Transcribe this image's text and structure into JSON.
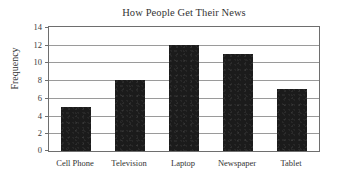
{
  "chart_data": {
    "type": "bar",
    "title": "How People Get Their News",
    "xlabel": "",
    "ylabel": "Frequency",
    "categories": [
      "Cell Phone",
      "Television",
      "Laptop",
      "Newspaper",
      "Tablet"
    ],
    "values": [
      5,
      8,
      12,
      11,
      7
    ],
    "ylim": [
      0,
      14
    ],
    "yticks": [
      0,
      2,
      4,
      6,
      8,
      10,
      12,
      14
    ],
    "ytick_labels": [
      "0",
      "2",
      "4",
      "6",
      "8",
      "10",
      "12",
      "14"
    ],
    "grid": "horizontal",
    "legend": "none",
    "bar_color": "#1b1b1b",
    "axis_color": "#6e6e6e",
    "gridline_color": "#9a9a9a",
    "background": "#ffffff"
  }
}
